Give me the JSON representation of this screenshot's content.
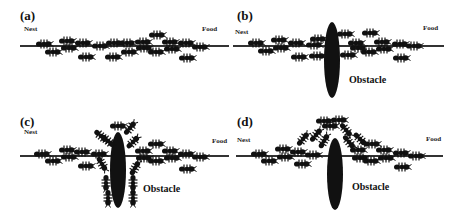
{
  "figure": {
    "panels": [
      {
        "id": "a",
        "label": "(a)",
        "nest_label": "Nest",
        "food_label": "Food",
        "has_obstacle": false,
        "obstacle_label": "",
        "trail": {
          "x1": 20,
          "x2": 229,
          "y": 46
        },
        "ants": [
          {
            "x": 44,
            "y": 44,
            "r": 0
          },
          {
            "x": 53,
            "y": 52,
            "r": 0
          },
          {
            "x": 67,
            "y": 41,
            "r": 0
          },
          {
            "x": 69,
            "y": 48,
            "r": 0
          },
          {
            "x": 83,
            "y": 43,
            "r": 0
          },
          {
            "x": 86,
            "y": 57,
            "r": 0
          },
          {
            "x": 100,
            "y": 46,
            "r": 0
          },
          {
            "x": 114,
            "y": 43,
            "r": 0
          },
          {
            "x": 113,
            "y": 57,
            "r": 0
          },
          {
            "x": 127,
            "y": 43,
            "r": 0
          },
          {
            "x": 129,
            "y": 52,
            "r": 0
          },
          {
            "x": 143,
            "y": 42,
            "r": 0
          },
          {
            "x": 144,
            "y": 48,
            "r": 0
          },
          {
            "x": 157,
            "y": 35,
            "r": 0
          },
          {
            "x": 156,
            "y": 52,
            "r": 0
          },
          {
            "x": 170,
            "y": 42,
            "r": 0
          },
          {
            "x": 172,
            "y": 49,
            "r": 0
          },
          {
            "x": 186,
            "y": 43,
            "r": 0
          },
          {
            "x": 187,
            "y": 58,
            "r": 0
          },
          {
            "x": 200,
            "y": 47,
            "r": 0
          }
        ]
      },
      {
        "id": "b",
        "label": "(b)",
        "nest_label": "Nest",
        "food_label": "Food",
        "has_obstacle": true,
        "obstacle_label": "Obstacle",
        "obstacle": {
          "cx": 101,
          "cy": 60,
          "rx": 8,
          "ry": 38
        },
        "trail": {
          "x1": 2,
          "x2": 213,
          "y": 46
        },
        "ants": [
          {
            "x": 25,
            "y": 43,
            "r": 0
          },
          {
            "x": 35,
            "y": 51,
            "r": 0
          },
          {
            "x": 48,
            "y": 40,
            "r": 0
          },
          {
            "x": 50,
            "y": 48,
            "r": 0
          },
          {
            "x": 65,
            "y": 43,
            "r": 0
          },
          {
            "x": 68,
            "y": 57,
            "r": 0
          },
          {
            "x": 83,
            "y": 45,
            "r": 0
          },
          {
            "x": 87,
            "y": 39,
            "r": 0
          },
          {
            "x": 86,
            "y": 56,
            "r": 0
          },
          {
            "x": 114,
            "y": 34,
            "r": 0
          },
          {
            "x": 117,
            "y": 55,
            "r": 0
          },
          {
            "x": 125,
            "y": 43,
            "r": 0
          },
          {
            "x": 127,
            "y": 48,
            "r": 0
          },
          {
            "x": 139,
            "y": 33,
            "r": 0
          },
          {
            "x": 138,
            "y": 52,
            "r": 0
          },
          {
            "x": 151,
            "y": 42,
            "r": 0
          },
          {
            "x": 153,
            "y": 49,
            "r": 0
          },
          {
            "x": 169,
            "y": 44,
            "r": 0
          },
          {
            "x": 170,
            "y": 58,
            "r": 0
          },
          {
            "x": 183,
            "y": 46,
            "r": 0
          }
        ]
      },
      {
        "id": "c",
        "label": "(c)",
        "nest_label": "Nest",
        "food_label": "Food",
        "has_obstacle": true,
        "obstacle_label": "Obstacle",
        "obstacle": {
          "cx": 118,
          "cy": 62,
          "rx": 8,
          "ry": 38
        },
        "trail": {
          "x1": 20,
          "x2": 229,
          "y": 48
        },
        "ants": [
          {
            "x": 42,
            "y": 46,
            "r": 0
          },
          {
            "x": 53,
            "y": 53,
            "r": 0
          },
          {
            "x": 67,
            "y": 42,
            "r": 0
          },
          {
            "x": 69,
            "y": 49,
            "r": 0
          },
          {
            "x": 82,
            "y": 44,
            "r": 0
          },
          {
            "x": 86,
            "y": 58,
            "r": 0
          },
          {
            "x": 99,
            "y": 46,
            "r": 0
          },
          {
            "x": 101,
            "y": 28,
            "r": 40
          },
          {
            "x": 108,
            "y": 33,
            "r": 40
          },
          {
            "x": 118,
            "y": 18,
            "r": 0
          },
          {
            "x": 102,
            "y": 56,
            "r": 60
          },
          {
            "x": 106,
            "y": 75,
            "r": 90
          },
          {
            "x": 108,
            "y": 90,
            "r": 90
          },
          {
            "x": 130,
            "y": 20,
            "r": -50
          },
          {
            "x": 133,
            "y": 34,
            "r": -45
          },
          {
            "x": 135,
            "y": 60,
            "r": -60
          },
          {
            "x": 133,
            "y": 75,
            "r": 90
          },
          {
            "x": 133,
            "y": 90,
            "r": 90
          },
          {
            "x": 143,
            "y": 43,
            "r": 0
          },
          {
            "x": 144,
            "y": 50,
            "r": 0
          },
          {
            "x": 156,
            "y": 36,
            "r": 0
          },
          {
            "x": 156,
            "y": 53,
            "r": 0
          },
          {
            "x": 170,
            "y": 43,
            "r": 0
          },
          {
            "x": 172,
            "y": 50,
            "r": 0
          },
          {
            "x": 186,
            "y": 46,
            "r": 0
          },
          {
            "x": 187,
            "y": 61,
            "r": 0
          },
          {
            "x": 200,
            "y": 49,
            "r": 0
          }
        ]
      },
      {
        "id": "d",
        "label": "(d)",
        "nest_label": "Nest",
        "food_label": "Food",
        "has_obstacle": true,
        "obstacle_label": "Obstacle",
        "obstacle": {
          "cx": 104,
          "cy": 66,
          "rx": 8,
          "ry": 36
        },
        "trail": {
          "x1": 5,
          "x2": 212,
          "y": 48
        },
        "ants": [
          {
            "x": 28,
            "y": 46,
            "r": 0
          },
          {
            "x": 38,
            "y": 53,
            "r": 0
          },
          {
            "x": 52,
            "y": 41,
            "r": 0
          },
          {
            "x": 54,
            "y": 49,
            "r": 0
          },
          {
            "x": 67,
            "y": 44,
            "r": 0
          },
          {
            "x": 71,
            "y": 56,
            "r": 0
          },
          {
            "x": 82,
            "y": 47,
            "r": 0
          },
          {
            "x": 72,
            "y": 31,
            "r": -50
          },
          {
            "x": 85,
            "y": 27,
            "r": -50
          },
          {
            "x": 93,
            "y": 33,
            "r": -60
          },
          {
            "x": 93,
            "y": 13,
            "r": 0
          },
          {
            "x": 99,
            "y": 18,
            "r": 0
          },
          {
            "x": 108,
            "y": 12,
            "r": 0
          },
          {
            "x": 115,
            "y": 22,
            "r": 50
          },
          {
            "x": 118,
            "y": 34,
            "r": 50
          },
          {
            "x": 129,
            "y": 31,
            "r": 45
          },
          {
            "x": 141,
            "y": 36,
            "r": 0
          },
          {
            "x": 127,
            "y": 42,
            "r": 0
          },
          {
            "x": 129,
            "y": 50,
            "r": 0
          },
          {
            "x": 140,
            "y": 53,
            "r": 0
          },
          {
            "x": 153,
            "y": 42,
            "r": 0
          },
          {
            "x": 155,
            "y": 50,
            "r": 0
          },
          {
            "x": 170,
            "y": 45,
            "r": 0
          },
          {
            "x": 171,
            "y": 59,
            "r": 0
          },
          {
            "x": 185,
            "y": 48,
            "r": 0
          }
        ]
      }
    ],
    "colors": {
      "ink": "#111111",
      "trail": "#333333",
      "background": "#ffffff"
    }
  }
}
